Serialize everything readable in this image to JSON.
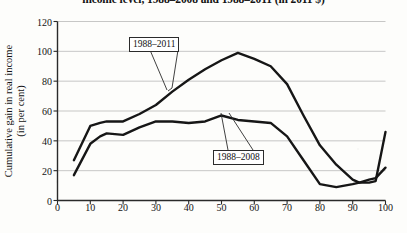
{
  "chart_data": {
    "type": "line",
    "title": "income level, 1988–2008 and 1988–2011 (in 2011 $)",
    "xlabel": "Percentile of global distribution",
    "ylabel_line1": "Cumulative gain in real income",
    "ylabel_line2": "(in per cent)",
    "xlim": [
      0,
      100
    ],
    "ylim": [
      0,
      120
    ],
    "xticks": [
      0,
      10,
      20,
      30,
      40,
      50,
      60,
      70,
      80,
      90,
      100
    ],
    "yticks": [
      0,
      20,
      40,
      60,
      80,
      100,
      120
    ],
    "grid": "horizontal",
    "legend_position": "inline-callout",
    "line_color": "#161616",
    "grid_color": "#b9b9b9",
    "axis_color": "#2a2a2a",
    "background": "#fdfdfb",
    "series": [
      {
        "name": "1988–2011",
        "label_x": 37,
        "label_y": 77,
        "x": [
          5,
          10,
          13,
          15,
          20,
          25,
          30,
          35,
          40,
          45,
          50,
          55,
          60,
          65,
          70,
          75,
          80,
          85,
          90,
          92,
          95,
          97,
          100
        ],
        "values": [
          27,
          50,
          52,
          53,
          53,
          58,
          64,
          73,
          81,
          88,
          94,
          99,
          95,
          90,
          78,
          57,
          37,
          24,
          14,
          12,
          12,
          13,
          46
        ]
      },
      {
        "name": "1988–2008",
        "label_x": 50,
        "label_y": 57,
        "x": [
          5,
          10,
          13,
          15,
          20,
          25,
          30,
          35,
          40,
          45,
          50,
          55,
          60,
          65,
          70,
          75,
          80,
          85,
          90,
          92,
          95,
          97,
          100
        ],
        "values": [
          17,
          38,
          43,
          45,
          44,
          49,
          53,
          53,
          52,
          53,
          57,
          54,
          53,
          52,
          43,
          27,
          11,
          9,
          11,
          12,
          14,
          15,
          22
        ]
      }
    ]
  }
}
